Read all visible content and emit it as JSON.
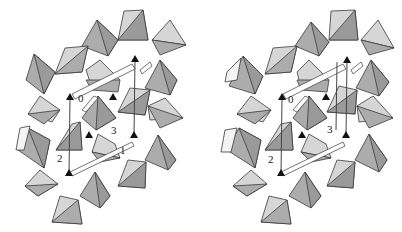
{
  "figure": {
    "type": "stereo-pair",
    "colors": {
      "light_face": "#d6d6d6",
      "mid_face": "#acacac",
      "dark_face": "#9a9a9a",
      "edge": "#3a3a3a",
      "marker": "#111111"
    },
    "views": [
      {
        "name": "left",
        "labels": [
          {
            "text": "0",
            "x": 78,
            "y": 102
          },
          {
            "text": "3",
            "x": 111,
            "y": 134
          },
          {
            "text": "1",
            "x": 120,
            "y": 154
          },
          {
            "text": "2",
            "x": 57,
            "y": 162
          }
        ],
        "markers": [
          {
            "x": 70,
            "y": 98
          },
          {
            "x": 113,
            "y": 98
          },
          {
            "x": 135,
            "y": 60
          },
          {
            "x": 89,
            "y": 136
          },
          {
            "x": 134,
            "y": 136
          },
          {
            "x": 69,
            "y": 174
          }
        ]
      },
      {
        "name": "right",
        "labels": [
          {
            "text": "0",
            "x": 87,
            "y": 103
          },
          {
            "text": "3",
            "x": 126,
            "y": 133
          },
          {
            "text": "2",
            "x": 67,
            "y": 163
          }
        ],
        "markers": [
          {
            "x": 81,
            "y": 98
          },
          {
            "x": 125,
            "y": 98
          },
          {
            "x": 146,
            "y": 61
          },
          {
            "x": 101,
            "y": 136
          },
          {
            "x": 145,
            "y": 136
          },
          {
            "x": 80,
            "y": 174
          }
        ]
      }
    ]
  }
}
